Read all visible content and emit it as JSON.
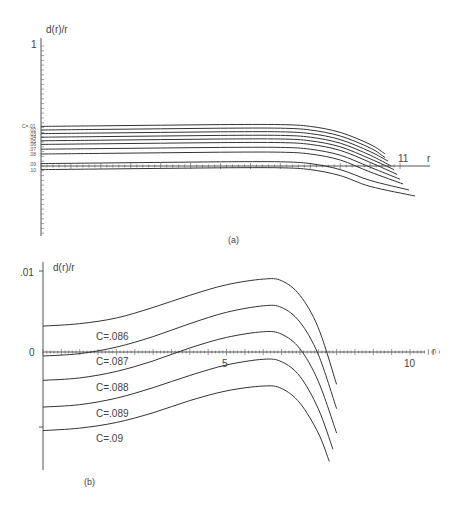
{
  "chart_data": [
    {
      "panel": "a",
      "type": "line",
      "caption": "(a)",
      "ylabel": "d(r)/r",
      "xlabel": "r",
      "y_tick_labels": [
        "1"
      ],
      "x_tick_labels": [
        "11"
      ],
      "legend_prefix": "C=",
      "series_labels": [
        ".01",
        ".02",
        ".03",
        ".04",
        ".05",
        ".06",
        ".07",
        ".08",
        ".09",
        ".10"
      ],
      "series": [
        {
          "name": "C=.01",
          "x": [
            0,
            2,
            4,
            6,
            8,
            9,
            10,
            11,
            11.5
          ],
          "y": [
            0.33,
            0.335,
            0.34,
            0.345,
            0.345,
            0.33,
            0.28,
            0.18,
            0.1
          ]
        },
        {
          "name": "C=.02",
          "x": [
            0,
            2,
            4,
            6,
            8,
            9,
            10,
            11,
            11.5
          ],
          "y": [
            0.3,
            0.305,
            0.31,
            0.315,
            0.315,
            0.3,
            0.25,
            0.15,
            0.07
          ]
        },
        {
          "name": "C=.03",
          "x": [
            0,
            2,
            4,
            6,
            8,
            9,
            10,
            11,
            11.6
          ],
          "y": [
            0.27,
            0.275,
            0.28,
            0.285,
            0.285,
            0.27,
            0.22,
            0.12,
            0.04
          ]
        },
        {
          "name": "C=.04",
          "x": [
            0,
            2,
            4,
            6,
            8,
            9,
            10,
            11,
            11.7
          ],
          "y": [
            0.24,
            0.245,
            0.25,
            0.255,
            0.255,
            0.24,
            0.19,
            0.09,
            0.0
          ]
        },
        {
          "name": "C=.05",
          "x": [
            0,
            2,
            4,
            6,
            8,
            9,
            10,
            11,
            11.8
          ],
          "y": [
            0.21,
            0.215,
            0.22,
            0.225,
            0.225,
            0.21,
            0.16,
            0.06,
            -0.03
          ]
        },
        {
          "name": "C=.06",
          "x": [
            0,
            2,
            4,
            6,
            8,
            9,
            10,
            11,
            11.9
          ],
          "y": [
            0.18,
            0.185,
            0.19,
            0.195,
            0.195,
            0.18,
            0.13,
            0.03,
            -0.07
          ]
        },
        {
          "name": "C=.07",
          "x": [
            0,
            2,
            4,
            6,
            8,
            9,
            10,
            11,
            12
          ],
          "y": [
            0.14,
            0.145,
            0.15,
            0.155,
            0.155,
            0.14,
            0.09,
            -0.01,
            -0.11
          ]
        },
        {
          "name": "C=.08",
          "x": [
            0,
            2,
            4,
            6,
            8,
            9,
            10,
            11,
            12.1
          ],
          "y": [
            0.1,
            0.105,
            0.11,
            0.115,
            0.115,
            0.1,
            0.05,
            -0.05,
            -0.15
          ]
        },
        {
          "name": "C=.09",
          "x": [
            0,
            2,
            4,
            6,
            8,
            9,
            10,
            11,
            12.3
          ],
          "y": [
            0.02,
            0.025,
            0.03,
            0.035,
            0.035,
            0.02,
            -0.03,
            -0.12,
            -0.2
          ]
        },
        {
          "name": "C=.10",
          "x": [
            0,
            2,
            4,
            6,
            8,
            9,
            10,
            11,
            12.5
          ],
          "y": [
            -0.03,
            -0.025,
            -0.02,
            -0.015,
            -0.015,
            -0.03,
            -0.08,
            -0.17,
            -0.25
          ]
        }
      ],
      "ylim": [
        -0.4,
        1.0
      ],
      "xlim": [
        0,
        13
      ],
      "grid": false
    },
    {
      "panel": "b",
      "type": "line",
      "caption": "(b)",
      "ylabel": "d(r)/r",
      "xlabel": "r",
      "y_tick_labels": [
        ".01",
        "0"
      ],
      "x_tick_labels": [
        "5",
        "10"
      ],
      "series": [
        {
          "name": "C=.086",
          "x": [
            0,
            1,
            2,
            3,
            4,
            5,
            6,
            6.5,
            7,
            7.5,
            8
          ],
          "y": [
            0.0032,
            0.0035,
            0.0042,
            0.0055,
            0.007,
            0.0083,
            0.009,
            0.0088,
            0.007,
            0.003,
            -0.004
          ]
        },
        {
          "name": "C=.087",
          "x": [
            0,
            1,
            2,
            3,
            4,
            5,
            6,
            6.5,
            7,
            7.5,
            8
          ],
          "y": [
            -0.0005,
            -0.0002,
            0.0006,
            0.0019,
            0.0035,
            0.0049,
            0.0057,
            0.0055,
            0.0037,
            -0.0003,
            -0.007
          ]
        },
        {
          "name": "C=.087b",
          "x": [
            0,
            1,
            2,
            3,
            4,
            5,
            6,
            6.5,
            7,
            7.5,
            8
          ],
          "y": [
            -0.0035,
            -0.0032,
            -0.0024,
            -0.0011,
            0.0005,
            0.0018,
            0.0025,
            0.0022,
            0.0004,
            -0.0036,
            -0.01
          ]
        },
        {
          "name": "C=.088",
          "x": [
            0,
            1,
            2,
            3,
            4,
            5,
            6,
            6.5,
            7,
            7.5,
            7.9
          ],
          "y": [
            -0.0068,
            -0.0065,
            -0.0057,
            -0.0044,
            -0.0029,
            -0.0016,
            -0.0009,
            -0.0012,
            -0.003,
            -0.007,
            -0.012
          ]
        },
        {
          "name": "C=.089",
          "x": [
            0,
            1,
            2,
            3,
            4,
            5,
            6,
            6.5,
            7,
            7.5,
            7.8
          ],
          "y": [
            -0.0097,
            -0.0094,
            -0.0087,
            -0.0075,
            -0.006,
            -0.0048,
            -0.0042,
            -0.0045,
            -0.0063,
            -0.01,
            -0.0135
          ]
        }
      ],
      "curve_labels": [
        "C=.086",
        "C=.087",
        "C=.088",
        "C=.089",
        "C=.09"
      ],
      "ylim": [
        -0.016,
        0.011
      ],
      "xlim": [
        0,
        11
      ],
      "grid": false
    }
  ]
}
